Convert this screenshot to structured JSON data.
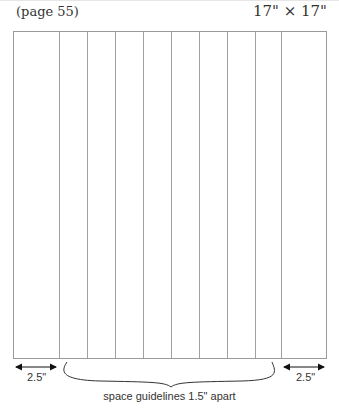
{
  "header": {
    "page_ref": "(page 55)",
    "dimensions": "17\" × 17\""
  },
  "diagram": {
    "outline": {
      "x": 13,
      "y": 31,
      "width": 313,
      "height": 327
    },
    "guidelines_x": [
      59,
      87,
      115,
      143,
      171,
      199,
      227,
      255,
      281
    ],
    "line_color": "#9a9a9a"
  },
  "annotations": {
    "left_margin": "2.5\"",
    "right_margin": "2.5\"",
    "spacing_note": "space guidelines 1.5\" apart"
  }
}
